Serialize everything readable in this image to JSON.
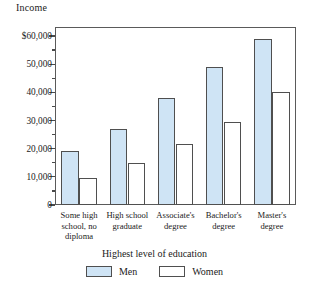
{
  "chart_data": {
    "type": "bar",
    "title": "",
    "ylabel": "Income",
    "xlabel": "Highest level of education",
    "categories": [
      "Some high\nschool, no\ndiploma",
      "High school\ngraduate",
      "Associate's\ndegree",
      "Bachelor's\ndegree",
      "Master's\ndegree"
    ],
    "series": [
      {
        "name": "Men",
        "color": "#cfe4f5",
        "values": [
          19000,
          27000,
          38000,
          49000,
          59000
        ]
      },
      {
        "name": "Women",
        "color": "#ffffff",
        "values": [
          9500,
          15000,
          21500,
          29500,
          40000
        ]
      }
    ],
    "ylim": [
      0,
      63000
    ],
    "ytick_labels": [
      "$60,000",
      "50,000",
      "40,000",
      "30,000",
      "20,000",
      "10,000",
      "0"
    ],
    "ytick_values": [
      60000,
      50000,
      40000,
      30000,
      20000,
      10000,
      0
    ],
    "yminor_values": [
      55000,
      45000,
      35000,
      25000,
      15000,
      5000
    ],
    "grid": false,
    "legend_position": "bottom"
  },
  "legend": {
    "items": [
      {
        "label": "Men",
        "swatch": "men-swatch"
      },
      {
        "label": "Women",
        "swatch": "women-swatch"
      }
    ]
  }
}
